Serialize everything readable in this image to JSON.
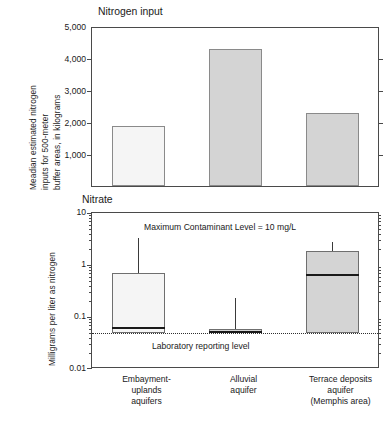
{
  "figure": {
    "panels": [
      {
        "title": "Nitrogen input",
        "ylabel_lines": [
          "Meadian estimated nitrogen",
          "inputs for 500-meter",
          "buffer areas, in kilograms"
        ]
      },
      {
        "title": "Nitrate",
        "ylabel_lines": [
          "Milligrams per liter as nitrogen"
        ],
        "annotations": {
          "mcl": "Maximum Contaminant Level = 10 mg/L",
          "reporting_level": "Laboratory reporting level"
        }
      }
    ],
    "categories": [
      {
        "lines": [
          "Embayment-",
          "uplands",
          "aquifers"
        ]
      },
      {
        "lines": [
          "Alluvial",
          "aquifer"
        ]
      },
      {
        "lines": [
          "Terrace deposits",
          "aquifer",
          "(Memphis area)"
        ]
      }
    ],
    "colors": {
      "bar_light": "#f5f5f5",
      "bar_gray": "#d4d4d4",
      "axis": "#4a4a4a",
      "median": "#1a1a1a",
      "reporting_line": "#2f2f2f"
    }
  },
  "chart_data": [
    {
      "type": "bar",
      "title": "Nitrogen input",
      "xlabel": "",
      "ylabel": "Meadian estimated nitrogen inputs for 500-meter buffer areas, in kilograms",
      "categories": [
        "Embayment-uplands aquifers",
        "Alluvial aquifer",
        "Terrace deposits aquifer (Memphis area)"
      ],
      "values": [
        1870,
        4280,
        2280
      ],
      "ylim": [
        0,
        5000
      ],
      "yticks": [
        0,
        1000,
        2000,
        3000,
        4000,
        5000
      ],
      "ytick_labels": [
        "",
        "1,000",
        "2,000",
        "3,000",
        "4,000",
        "5,000"
      ],
      "bar_fills": [
        "#f5f5f5",
        "#d4d4d4",
        "#d4d4d4"
      ],
      "grid": false,
      "legend": "none"
    },
    {
      "type": "box",
      "title": "Nitrate",
      "xlabel": "",
      "ylabel": "Milligrams per liter as nitrogen",
      "yscale": "log",
      "ylim": [
        0.01,
        10
      ],
      "yticks": [
        0.01,
        0.1,
        1,
        10
      ],
      "ytick_labels": [
        "0.01",
        "0.1",
        "1",
        "10"
      ],
      "categories": [
        "Embayment-uplands aquifers",
        "Alluvial aquifer",
        "Terrace deposits aquifer (Memphis area)"
      ],
      "boxes": [
        {
          "whisker_high": 3.3,
          "q3": 0.7,
          "median": 0.062,
          "q1": 0.05,
          "fill": "#f5f5f5"
        },
        {
          "whisker_high": 0.23,
          "q3": 0.058,
          "median": 0.052,
          "q1": 0.05,
          "fill": "#d4d4d4"
        },
        {
          "whisker_high": 2.8,
          "q3": 1.85,
          "median": 0.65,
          "q1": 0.05,
          "fill": "#d4d4d4"
        }
      ],
      "reference_lines": [
        {
          "label": "Laboratory reporting level",
          "value": 0.05,
          "style": "dotted"
        }
      ],
      "annotations": [
        "Maximum Contaminant Level = 10 mg/L"
      ],
      "grid": false,
      "legend": "none"
    }
  ]
}
